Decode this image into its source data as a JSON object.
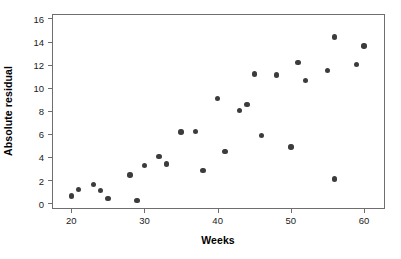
{
  "chart_data": {
    "type": "scatter",
    "title": "",
    "xlabel": "Weeks",
    "ylabel": "Absolute residual",
    "xlim": [
      17.5,
      63.0
    ],
    "ylim": [
      -0.6,
      16.3
    ],
    "xticks": [
      20,
      30,
      40,
      50,
      60
    ],
    "yticks": [
      0,
      2,
      4,
      6,
      8,
      10,
      12,
      14,
      16
    ],
    "grid": false,
    "legend": null,
    "marker": {
      "shape": "circle",
      "color": "#3c3c3c",
      "size_px": 5.4
    },
    "frame_color": "#6e6e6e",
    "series": [
      {
        "name": "Absolute residual vs Weeks",
        "points": [
          {
            "x": 20,
            "y": 0.6
          },
          {
            "x": 21,
            "y": 1.2
          },
          {
            "x": 23,
            "y": 1.6
          },
          {
            "x": 24,
            "y": 1.1
          },
          {
            "x": 25,
            "y": 0.4
          },
          {
            "x": 28,
            "y": 2.45
          },
          {
            "x": 29,
            "y": 0.2
          },
          {
            "x": 30,
            "y": 3.25
          },
          {
            "x": 32,
            "y": 4.05
          },
          {
            "x": 33,
            "y": 3.4
          },
          {
            "x": 35,
            "y": 6.15
          },
          {
            "x": 37,
            "y": 6.2
          },
          {
            "x": 38,
            "y": 2.85
          },
          {
            "x": 40,
            "y": 9.05
          },
          {
            "x": 41,
            "y": 4.45
          },
          {
            "x": 43,
            "y": 8.0
          },
          {
            "x": 44,
            "y": 8.55
          },
          {
            "x": 45,
            "y": 11.2
          },
          {
            "x": 46,
            "y": 5.85
          },
          {
            "x": 48,
            "y": 11.1
          },
          {
            "x": 50,
            "y": 4.85
          },
          {
            "x": 51,
            "y": 12.2
          },
          {
            "x": 52,
            "y": 10.6
          },
          {
            "x": 55,
            "y": 11.5
          },
          {
            "x": 56,
            "y": 14.4
          },
          {
            "x": 56,
            "y": 2.1
          },
          {
            "x": 59,
            "y": 12.0
          },
          {
            "x": 60,
            "y": 13.6
          }
        ]
      }
    ]
  }
}
